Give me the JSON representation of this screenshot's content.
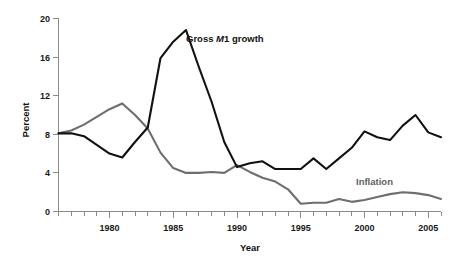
{
  "chart_data": {
    "type": "line",
    "title": "",
    "xlabel": "Year",
    "ylabel": "Percent",
    "xlim": [
      1976,
      2006
    ],
    "ylim": [
      0,
      20
    ],
    "yticks": [
      0,
      4,
      8,
      12,
      16,
      20
    ],
    "ytick_labels": [
      "0",
      "4",
      "8",
      "12",
      "16",
      "20"
    ],
    "xticks": [
      1980,
      1985,
      1990,
      1995,
      2000,
      2005
    ],
    "xtick_labels": [
      "1980",
      "1985",
      "1990",
      "1995",
      "2000",
      "2005"
    ],
    "minor_xtick_interval": 1,
    "grid": false,
    "legend_position": "inline-annotations",
    "x": [
      1976,
      1977,
      1978,
      1979,
      1980,
      1981,
      1982,
      1983,
      1984,
      1985,
      1986,
      1987,
      1988,
      1989,
      1990,
      1991,
      1992,
      1993,
      1994,
      1995,
      1996,
      1997,
      1998,
      1999,
      2000,
      2001,
      2002,
      2003,
      2004,
      2005,
      2006
    ],
    "series": [
      {
        "name": "Gross M1 growth",
        "color": "#111111",
        "values": [
          8.1,
          8.1,
          7.8,
          6.9,
          6.0,
          5.6,
          7.2,
          8.7,
          15.9,
          17.6,
          18.8,
          15.0,
          11.4,
          7.2,
          4.6,
          5.0,
          5.2,
          4.4,
          4.4,
          4.4,
          5.5,
          4.4,
          5.5,
          6.6,
          8.3,
          7.7,
          7.4,
          8.9,
          10.0,
          8.2,
          7.7
        ]
      },
      {
        "name": "Inflation",
        "color": "#6e6e6e",
        "values": [
          8.1,
          8.4,
          9.0,
          9.8,
          10.6,
          11.2,
          10.0,
          8.6,
          6.1,
          4.5,
          4.0,
          4.0,
          4.1,
          4.0,
          4.8,
          4.1,
          3.5,
          3.1,
          2.3,
          0.8,
          0.9,
          0.9,
          1.3,
          1.0,
          1.2,
          1.5,
          1.8,
          2.0,
          1.9,
          1.7,
          1.3
        ]
      }
    ],
    "annotations": [
      {
        "text": "Gross M1 growth",
        "italic_token": "M",
        "x": 1987.9,
        "y": 16.9,
        "color": "#111111"
      },
      {
        "text": "Inflation",
        "x": 2000.6,
        "y": 3.4,
        "color": "#5f5f5f"
      }
    ]
  },
  "series_extra": {
    "m1_tail_x": [
      2005,
      2006
    ],
    "m1_tail_y": [
      7.7,
      7.7
    ]
  }
}
